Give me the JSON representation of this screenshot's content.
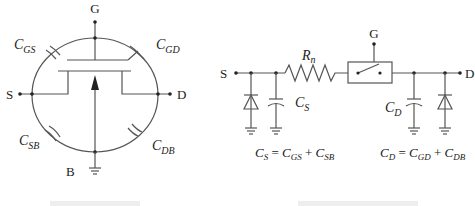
{
  "mosfet_diagram": {
    "terminals": {
      "gate": "G",
      "source": "S",
      "drain": "D",
      "body": "B"
    },
    "capacitors": [
      {
        "main": "C",
        "sub": "GS"
      },
      {
        "main": "C",
        "sub": "GD"
      },
      {
        "main": "C",
        "sub": "SB"
      },
      {
        "main": "C",
        "sub": "DB"
      }
    ],
    "caption": "(clipped caption)"
  },
  "switch_model": {
    "terminals": {
      "source": "S",
      "drain": "D",
      "gate": "G"
    },
    "resistor": {
      "main": "R",
      "sub": "n"
    },
    "source_cap": {
      "main": "C",
      "sub": "S"
    },
    "drain_cap": {
      "main": "C",
      "sub": "D"
    },
    "eq_source": {
      "lhs_main": "C",
      "lhs_sub": "S",
      "eq": " = ",
      "t1_main": "C",
      "t1_sub": "GS",
      "plus": " + ",
      "t2_main": "C",
      "t2_sub": "SB"
    },
    "eq_drain": {
      "lhs_main": "C",
      "lhs_sub": "D",
      "eq": " = ",
      "t1_main": "C",
      "t1_sub": "GD",
      "plus": " + ",
      "t2_main": "C",
      "t2_sub": "DB"
    },
    "caption": "(clipped caption)"
  },
  "colors": {
    "line": "#555555",
    "text": "#222222",
    "background": "#ffffff"
  }
}
